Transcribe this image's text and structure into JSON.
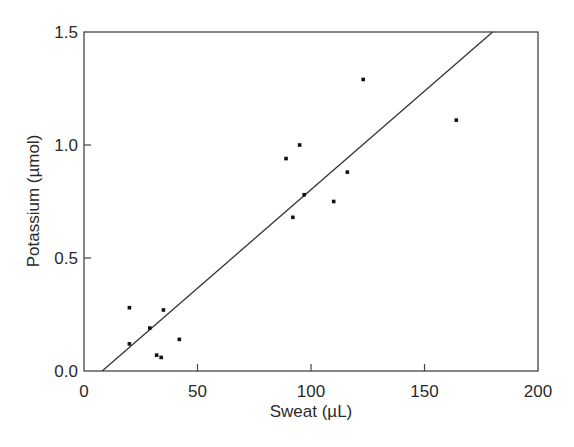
{
  "chart_data": {
    "type": "scatter",
    "title": "",
    "xlabel": "Sweat (µL)",
    "ylabel": "Potassium (µmol)",
    "xlim": [
      0,
      200
    ],
    "ylim": [
      0,
      1.5
    ],
    "xticks": [
      "0",
      "50",
      "100",
      "150",
      "200"
    ],
    "yticks": [
      "0.0",
      "0.5",
      "1.0",
      "1.5"
    ],
    "grid": false,
    "legend": null,
    "series": [
      {
        "name": "measurements",
        "points": [
          {
            "x": 20,
            "y": 0.28
          },
          {
            "x": 20,
            "y": 0.12
          },
          {
            "x": 29,
            "y": 0.19
          },
          {
            "x": 35,
            "y": 0.27
          },
          {
            "x": 32,
            "y": 0.07
          },
          {
            "x": 34,
            "y": 0.06
          },
          {
            "x": 42,
            "y": 0.14
          },
          {
            "x": 89,
            "y": 0.94
          },
          {
            "x": 95,
            "y": 1.0
          },
          {
            "x": 97,
            "y": 0.78
          },
          {
            "x": 92,
            "y": 0.68
          },
          {
            "x": 110,
            "y": 0.75
          },
          {
            "x": 116,
            "y": 0.88
          },
          {
            "x": 123,
            "y": 1.29
          },
          {
            "x": 164,
            "y": 1.11
          }
        ]
      }
    ],
    "fit_line": {
      "x0": 8,
      "y0": 0.0,
      "x1": 180,
      "y1": 1.5
    }
  }
}
